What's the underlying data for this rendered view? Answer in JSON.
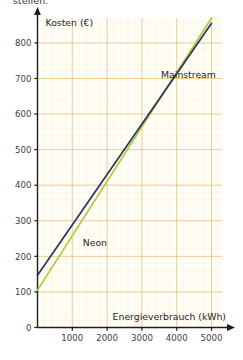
{
  "page": {
    "cut_off_text": "stellen."
  },
  "chart_data": {
    "type": "line",
    "title": "",
    "xlabel": "Energieverbrauch (kWh)",
    "ylabel": "Kosten (€)",
    "xlim": [
      0,
      5300
    ],
    "ylim": [
      0,
      870
    ],
    "xticks": [
      1000,
      2000,
      3000,
      4000,
      5000
    ],
    "xtick_labels": [
      "1000",
      "2000",
      "3000",
      "4000",
      "5000"
    ],
    "yticks": [
      0,
      100,
      200,
      300,
      400,
      500,
      600,
      700,
      800
    ],
    "ytick_labels": [
      "0",
      "100",
      "200",
      "300",
      "400",
      "500",
      "600",
      "700",
      "800"
    ],
    "grid": true,
    "grid_minor_step_x": 200,
    "grid_minor_step_y": 20,
    "legend_position": "inline-annotations",
    "series": [
      {
        "name": "Neon",
        "color": "#a8ce3a",
        "label_x": 1300,
        "label_y": 230,
        "points": [
          [
            0,
            105
          ],
          [
            5000,
            870
          ]
        ]
      },
      {
        "name": "Mainstream",
        "color": "#2f3162",
        "label_x": 3550,
        "label_y": 700,
        "points": [
          [
            0,
            147
          ],
          [
            5000,
            855
          ]
        ]
      }
    ],
    "colors": {
      "grid_minor": "#fdf6e0",
      "grid_major": "#e8b96a",
      "axis": "#1d1d1d",
      "plot_background": "#fffef8"
    }
  }
}
